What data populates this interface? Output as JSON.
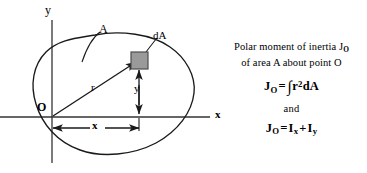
{
  "figure": {
    "title_lines": [
      "Polar moment of inertia J",
      "of area A about point O"
    ],
    "caption": {
      "line1_pre": "Polar moment of inertia J",
      "line1_sub": "O",
      "line2": "of area A about point O"
    },
    "formulas": {
      "first": {
        "lhs": "J",
        "lhs_sub": "O",
        "equals": "=",
        "integral": "∫",
        "var": "r",
        "exponent": "2",
        "differential": "dA"
      },
      "conjunction": "and",
      "second": {
        "lhs": "J",
        "lhs_sub": "O",
        "equals": "=",
        "term1": "I",
        "term1_sub": "x",
        "plus": "+",
        "term2": "I",
        "term2_sub": "y"
      }
    },
    "labels": {
      "y_axis": "y",
      "x_axis": "x",
      "origin": "O",
      "area": "A",
      "element": "dA",
      "radius": "r",
      "y_distance": "y",
      "x_distance": "x"
    },
    "colors": {
      "stroke": "#1a1a1a",
      "element_fill": "#9a9a9a",
      "element_stroke": "#4d4d4d",
      "background": "#ffffff"
    },
    "geometry": {
      "origin": [
        52,
        117
      ],
      "element_center": [
        139,
        60
      ],
      "element_size": 16,
      "y_axis_top": 20,
      "y_axis_bottom": 163,
      "x_axis_left": 0,
      "x_axis_right": 210
    }
  }
}
